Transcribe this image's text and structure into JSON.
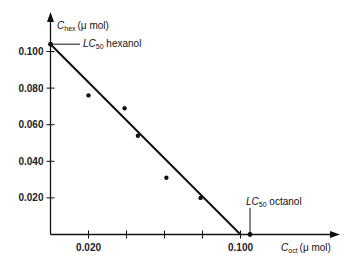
{
  "chart_data": {
    "type": "scatter",
    "title": "",
    "xlabel": "C_oct (μ mol)",
    "ylabel": "C_hex (μ mol)",
    "xlabel_parts": {
      "main": "C",
      "sub": "oct",
      "unit": "(μ mol)"
    },
    "ylabel_parts": {
      "main": "C",
      "sub": "hex",
      "unit": "(μ mol)"
    },
    "xlim": [
      0,
      0.115
    ],
    "ylim": [
      0,
      0.115
    ],
    "x_ticks": [
      0.02,
      0.04,
      0.06,
      0.08,
      0.1
    ],
    "x_tick_labels": [
      "0.020",
      "",
      "",
      "",
      "0.100"
    ],
    "y_ticks": [
      0.02,
      0.04,
      0.06,
      0.08,
      0.1
    ],
    "y_tick_labels": [
      "0.020",
      "0.040",
      "0.060",
      "0.080",
      "0.100"
    ],
    "grid": false,
    "series": [
      {
        "name": "measured",
        "kind": "scatter",
        "points": [
          {
            "x": 0.02,
            "y": 0.076
          },
          {
            "x": 0.039,
            "y": 0.069
          },
          {
            "x": 0.046,
            "y": 0.054
          },
          {
            "x": 0.061,
            "y": 0.031
          },
          {
            "x": 0.079,
            "y": 0.02
          }
        ]
      },
      {
        "name": "LC50 isobole",
        "kind": "line",
        "points": [
          {
            "x": 0.0,
            "y": 0.104
          },
          {
            "x": 0.1,
            "y": 0.0
          }
        ]
      }
    ],
    "annotations": [
      {
        "text": "LC50 hexanol",
        "main": "LC",
        "sub": "50",
        "rest": " hexanol",
        "x": 0.0,
        "y": 0.104
      },
      {
        "text": "LC50 octanol",
        "main": "LC",
        "sub": "50",
        "rest": " octanol",
        "x": 0.105,
        "y": 0.0
      }
    ]
  }
}
